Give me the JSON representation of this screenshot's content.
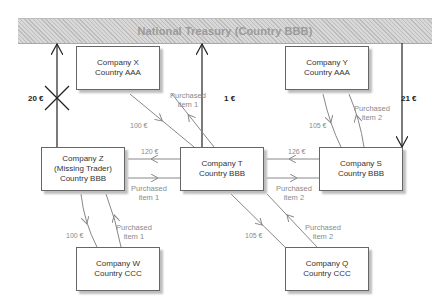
{
  "treasury": {
    "label": "National Treasury (Country BBB)"
  },
  "companies": {
    "x": {
      "name": "Company X",
      "country": "Country AAA"
    },
    "y": {
      "name": "Company Y",
      "country": "Country AAA"
    },
    "z": {
      "name": "Company Z",
      "note": "(Missing Trader)",
      "country": "Country BBB"
    },
    "t": {
      "name": "Company T",
      "country": "Country BBB"
    },
    "s": {
      "name": "Company S",
      "country": "Country BBB"
    },
    "w": {
      "name": "Company W",
      "country": "Country CCC"
    },
    "q": {
      "name": "Company Q",
      "country": "Country CCC"
    }
  },
  "tax_flows": {
    "z_to_treasury": "20 €",
    "t_to_treasury": "1 €",
    "treasury_to_s": "21 €"
  },
  "flows": {
    "x_t_money": "100 €",
    "x_t_item": [
      "Purchased",
      "item 1"
    ],
    "z_t_money": "120 €",
    "z_t_item": [
      "Purchased",
      "item 1"
    ],
    "s_t_money": "126 €",
    "s_t_item": [
      "Purchased",
      "item 2"
    ],
    "y_s_money": "105 €",
    "y_s_item": [
      "Purchased",
      "item 2"
    ],
    "w_z_money": "100 €",
    "w_z_item": [
      "Purchased",
      "item 1"
    ],
    "q_t_money": "105 €",
    "q_t_item": [
      "Purchased",
      "item 2"
    ]
  },
  "colors": {
    "box_border": "#666666",
    "flow_line": "#8a8a8a",
    "tax_line": "#222222",
    "treasury_fill": "#cfcfcf"
  }
}
